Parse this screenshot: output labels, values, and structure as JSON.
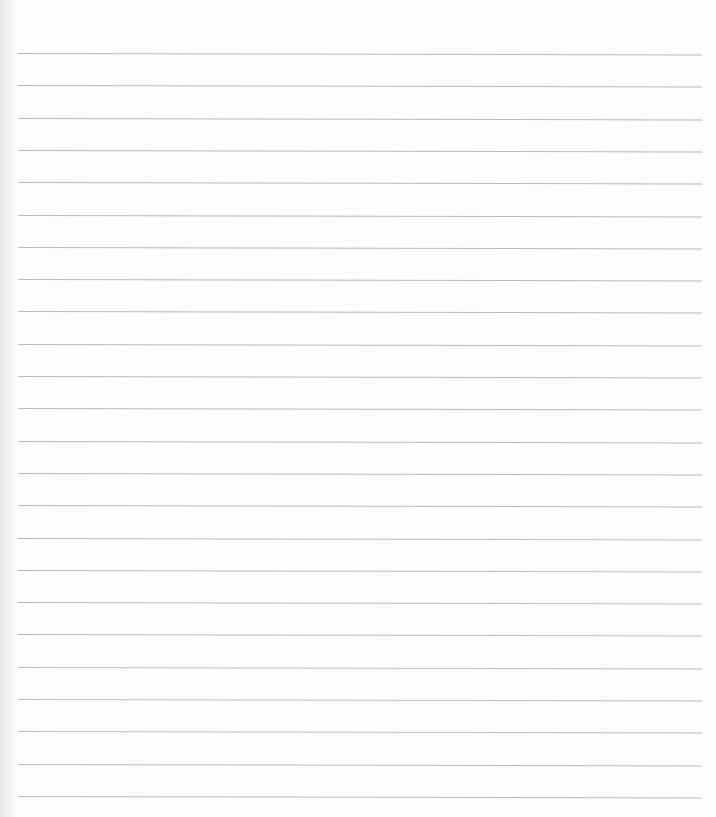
{
  "page": {
    "type": "lined-paper",
    "background_color": "#fdfdfd",
    "line_color": "#b9b9b9",
    "line_count": 24,
    "first_line_y": 53,
    "line_spacing_px": 32.3
  }
}
